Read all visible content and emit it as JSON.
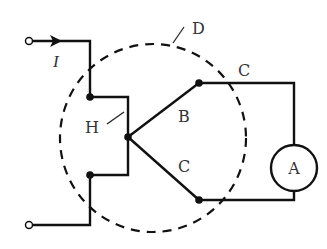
{
  "diagram": {
    "type": "circuit",
    "labels": {
      "current": "I",
      "region": "D",
      "junction": "H",
      "branch_upper": "B",
      "wire_upper": "C",
      "wire_lower": "C",
      "meter": "A"
    },
    "colors": {
      "line": "#111111",
      "text": "#333333",
      "background": "#ffffff"
    }
  }
}
